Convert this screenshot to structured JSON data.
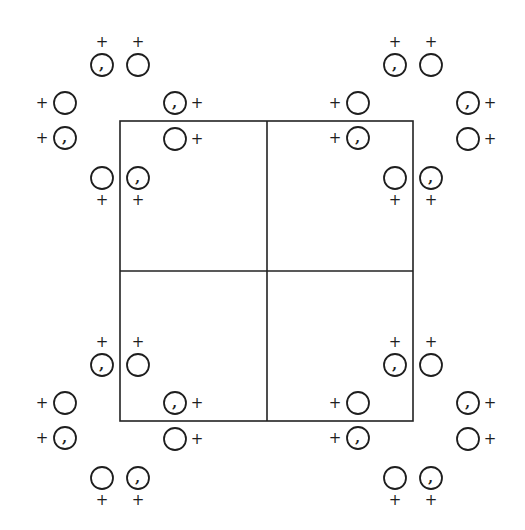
{
  "figure": {
    "type": "symmetry-equivalent-positions-diagram",
    "width": 525,
    "height": 530,
    "colors": {
      "background": "#ffffff",
      "ink": "#1e1e1e"
    },
    "unit_cell_grid": {
      "x0": 120,
      "y0": 121,
      "x1": 413,
      "y1": 421,
      "mid_x": 267,
      "mid_y": 271
    },
    "cluster_centers": [
      {
        "name": "top-left",
        "x": 120,
        "y": 121
      },
      {
        "name": "top-right",
        "x": 413,
        "y": 121
      },
      {
        "name": "bottom-left",
        "x": 120,
        "y": 421
      },
      {
        "name": "bottom-right",
        "x": 413,
        "y": 421
      }
    ],
    "circle_radius": 11,
    "height_sign_symbol": "+",
    "enantiomorph_symbol": ",",
    "cluster_positions": [
      {
        "dx": -18,
        "dy": -56,
        "comma": true,
        "sign": "+",
        "sign_dx": -18,
        "sign_dy": -79
      },
      {
        "dx": 18,
        "dy": -56,
        "comma": false,
        "sign": "+",
        "sign_dx": 18,
        "sign_dy": -79
      },
      {
        "dx": -55,
        "dy": -18,
        "comma": false,
        "sign": "+",
        "sign_dx": -78,
        "sign_dy": -18
      },
      {
        "dx": -55,
        "dy": 17,
        "comma": true,
        "sign": "+",
        "sign_dx": -78,
        "sign_dy": 17
      },
      {
        "dx": 55,
        "dy": -18,
        "comma": true,
        "sign": "+",
        "sign_dx": 77,
        "sign_dy": -18
      },
      {
        "dx": 55,
        "dy": 18,
        "comma": false,
        "sign": "+",
        "sign_dx": 77,
        "sign_dy": 18
      },
      {
        "dx": -18,
        "dy": 57,
        "comma": false,
        "sign": "+",
        "sign_dx": -18,
        "sign_dy": 79
      },
      {
        "dx": 18,
        "dy": 57,
        "comma": true,
        "sign": "+",
        "sign_dx": 18,
        "sign_dy": 79
      }
    ]
  }
}
